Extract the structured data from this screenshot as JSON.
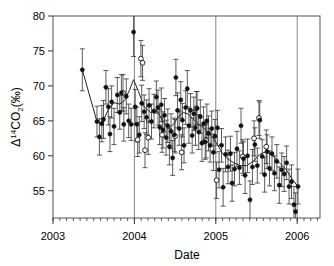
{
  "chart_data": {
    "type": "scatter",
    "title": "",
    "xlabel": "Date",
    "ylabel": "Δ¹⁴CO₂ (‰)",
    "ylabel_parts": {
      "delta": "Δ",
      "mass": "14",
      "species": "CO",
      "species_sub": "2",
      "units": "(‰)"
    },
    "xlim": [
      2003.0,
      2006.28
    ],
    "ylim": [
      51.1,
      80.0
    ],
    "xticks": [
      2003,
      2004,
      2005,
      2006
    ],
    "xtick_labels": [
      "2003",
      "2004",
      "2005",
      "2006"
    ],
    "yticks": [
      55,
      60,
      65,
      70,
      75,
      80
    ],
    "ytick_labels": [
      "55",
      "60",
      "65",
      "70",
      "75",
      "80"
    ],
    "x_minor_tick_interval": 0.08333,
    "grid": "vertical-only-at-year-boundaries",
    "gridlines_x": [
      2004,
      2005,
      2006
    ],
    "legend": "none",
    "marker_styles": {
      "filled": "filled-circle",
      "open": "open-circle"
    },
    "errorbars": true,
    "connecting_line": true,
    "series": [
      {
        "name": "filled",
        "marker": "filled-circle",
        "points": [
          {
            "x": 2003.36,
            "y": 72.3,
            "e": 3.0
          },
          {
            "x": 2003.54,
            "y": 64.9,
            "e": 2.2
          },
          {
            "x": 2003.57,
            "y": 62.7,
            "e": 2.6
          },
          {
            "x": 2003.6,
            "y": 64.6,
            "e": 2.6
          },
          {
            "x": 2003.62,
            "y": 65.2,
            "e": 2.7
          },
          {
            "x": 2003.65,
            "y": 69.8,
            "e": 2.4
          },
          {
            "x": 2003.68,
            "y": 67.0,
            "e": 2.6
          },
          {
            "x": 2003.7,
            "y": 63.1,
            "e": 2.5
          },
          {
            "x": 2003.72,
            "y": 67.7,
            "e": 2.3
          },
          {
            "x": 2003.75,
            "y": 64.2,
            "e": 2.6
          },
          {
            "x": 2003.79,
            "y": 68.7,
            "e": 2.5
          },
          {
            "x": 2003.82,
            "y": 66.2,
            "e": 2.4
          },
          {
            "x": 2003.84,
            "y": 69.0,
            "e": 2.6
          },
          {
            "x": 2003.87,
            "y": 64.5,
            "e": 2.4
          },
          {
            "x": 2003.9,
            "y": 68.5,
            "e": 2.5
          },
          {
            "x": 2003.93,
            "y": 65.0,
            "e": 2.4
          },
          {
            "x": 2003.96,
            "y": 64.5,
            "e": 2.3
          },
          {
            "x": 2003.99,
            "y": 77.7,
            "e": 3.5
          },
          {
            "x": 2004.01,
            "y": 67.0,
            "e": 2.5
          },
          {
            "x": 2004.03,
            "y": 64.5,
            "e": 2.5
          },
          {
            "x": 2004.06,
            "y": 63.0,
            "e": 2.6
          },
          {
            "x": 2004.09,
            "y": 67.5,
            "e": 2.6
          },
          {
            "x": 2004.12,
            "y": 66.3,
            "e": 2.4
          },
          {
            "x": 2004.15,
            "y": 65.5,
            "e": 2.5
          },
          {
            "x": 2004.18,
            "y": 67.2,
            "e": 2.4
          },
          {
            "x": 2004.21,
            "y": 64.9,
            "e": 2.5
          },
          {
            "x": 2004.24,
            "y": 66.4,
            "e": 2.4
          },
          {
            "x": 2004.27,
            "y": 68.4,
            "e": 2.3
          },
          {
            "x": 2004.29,
            "y": 66.9,
            "e": 2.5
          },
          {
            "x": 2004.31,
            "y": 64.1,
            "e": 2.5
          },
          {
            "x": 2004.33,
            "y": 67.3,
            "e": 2.4
          },
          {
            "x": 2004.35,
            "y": 63.7,
            "e": 2.6
          },
          {
            "x": 2004.37,
            "y": 65.8,
            "e": 2.4
          },
          {
            "x": 2004.39,
            "y": 62.6,
            "e": 2.5
          },
          {
            "x": 2004.41,
            "y": 64.3,
            "e": 2.4
          },
          {
            "x": 2004.43,
            "y": 61.3,
            "e": 2.6
          },
          {
            "x": 2004.45,
            "y": 63.5,
            "e": 2.5
          },
          {
            "x": 2004.47,
            "y": 59.7,
            "e": 2.5
          },
          {
            "x": 2004.49,
            "y": 63.0,
            "e": 2.4
          },
          {
            "x": 2004.51,
            "y": 71.2,
            "e": 2.6
          },
          {
            "x": 2004.53,
            "y": 66.5,
            "e": 2.5
          },
          {
            "x": 2004.55,
            "y": 63.9,
            "e": 2.4
          },
          {
            "x": 2004.57,
            "y": 68.0,
            "e": 2.6
          },
          {
            "x": 2004.59,
            "y": 65.1,
            "e": 2.4
          },
          {
            "x": 2004.61,
            "y": 61.5,
            "e": 2.5
          },
          {
            "x": 2004.63,
            "y": 66.9,
            "e": 2.4
          },
          {
            "x": 2004.65,
            "y": 69.6,
            "e": 2.6
          },
          {
            "x": 2004.67,
            "y": 64.3,
            "e": 2.5
          },
          {
            "x": 2004.69,
            "y": 66.5,
            "e": 2.4
          },
          {
            "x": 2004.71,
            "y": 62.9,
            "e": 2.5
          },
          {
            "x": 2004.73,
            "y": 66.0,
            "e": 2.4
          },
          {
            "x": 2004.75,
            "y": 64.0,
            "e": 2.5
          },
          {
            "x": 2004.77,
            "y": 66.8,
            "e": 2.4
          },
          {
            "x": 2004.79,
            "y": 63.4,
            "e": 2.5
          },
          {
            "x": 2004.81,
            "y": 65.6,
            "e": 2.4
          },
          {
            "x": 2004.83,
            "y": 61.8,
            "e": 2.6
          },
          {
            "x": 2004.85,
            "y": 64.6,
            "e": 2.4
          },
          {
            "x": 2004.87,
            "y": 62.0,
            "e": 2.5
          },
          {
            "x": 2004.89,
            "y": 65.0,
            "e": 2.4
          },
          {
            "x": 2004.91,
            "y": 63.2,
            "e": 2.5
          },
          {
            "x": 2004.93,
            "y": 61.5,
            "e": 2.4
          },
          {
            "x": 2004.95,
            "y": 63.9,
            "e": 2.5
          },
          {
            "x": 2004.97,
            "y": 60.5,
            "e": 2.6
          },
          {
            "x": 2004.99,
            "y": 62.8,
            "e": 2.4
          },
          {
            "x": 2005.02,
            "y": 64.0,
            "e": 2.5
          },
          {
            "x": 2005.04,
            "y": 58.0,
            "e": 2.6
          },
          {
            "x": 2005.07,
            "y": 61.5,
            "e": 2.4
          },
          {
            "x": 2005.09,
            "y": 55.5,
            "e": 2.7
          },
          {
            "x": 2005.12,
            "y": 60.2,
            "e": 2.5
          },
          {
            "x": 2005.15,
            "y": 58.4,
            "e": 2.4
          },
          {
            "x": 2005.18,
            "y": 60.3,
            "e": 2.5
          },
          {
            "x": 2005.2,
            "y": 56.1,
            "e": 2.6
          },
          {
            "x": 2005.23,
            "y": 58.1,
            "e": 2.4
          },
          {
            "x": 2005.26,
            "y": 61.0,
            "e": 2.5
          },
          {
            "x": 2005.29,
            "y": 58.3,
            "e": 2.4
          },
          {
            "x": 2005.31,
            "y": 64.3,
            "e": 2.5
          },
          {
            "x": 2005.34,
            "y": 59.6,
            "e": 2.4
          },
          {
            "x": 2005.36,
            "y": 57.2,
            "e": 2.6
          },
          {
            "x": 2005.39,
            "y": 60.0,
            "e": 2.4
          },
          {
            "x": 2005.42,
            "y": 53.7,
            "e": 2.7
          },
          {
            "x": 2005.45,
            "y": 58.4,
            "e": 2.5
          },
          {
            "x": 2005.48,
            "y": 61.6,
            "e": 2.4
          },
          {
            "x": 2005.51,
            "y": 58.6,
            "e": 2.5
          },
          {
            "x": 2005.54,
            "y": 65.1,
            "e": 2.6
          },
          {
            "x": 2005.57,
            "y": 59.9,
            "e": 2.4
          },
          {
            "x": 2005.6,
            "y": 57.3,
            "e": 2.5
          },
          {
            "x": 2005.63,
            "y": 60.6,
            "e": 2.4
          },
          {
            "x": 2005.66,
            "y": 58.2,
            "e": 2.5
          },
          {
            "x": 2005.69,
            "y": 60.3,
            "e": 2.4
          },
          {
            "x": 2005.72,
            "y": 57.5,
            "e": 2.5
          },
          {
            "x": 2005.75,
            "y": 59.2,
            "e": 2.4
          },
          {
            "x": 2005.78,
            "y": 55.8,
            "e": 2.6
          },
          {
            "x": 2005.81,
            "y": 58.0,
            "e": 2.4
          },
          {
            "x": 2005.84,
            "y": 57.4,
            "e": 2.5
          },
          {
            "x": 2005.87,
            "y": 59.0,
            "e": 2.4
          },
          {
            "x": 2005.9,
            "y": 55.6,
            "e": 2.5
          },
          {
            "x": 2005.93,
            "y": 56.3,
            "e": 2.4
          },
          {
            "x": 2005.96,
            "y": 53.0,
            "e": 2.6
          },
          {
            "x": 2005.98,
            "y": 52.0,
            "e": 2.7
          },
          {
            "x": 2006.01,
            "y": 55.6,
            "e": 2.5
          }
        ]
      },
      {
        "name": "open",
        "marker": "open-circle",
        "points": [
          {
            "x": 2003.86,
            "y": 69.0,
            "e": 2.6
          },
          {
            "x": 2004.04,
            "y": 62.3,
            "e": 2.4
          },
          {
            "x": 2004.08,
            "y": 73.9,
            "e": 2.6
          },
          {
            "x": 2004.1,
            "y": 73.3,
            "e": 2.5
          },
          {
            "x": 2004.13,
            "y": 60.8,
            "e": 2.5
          },
          {
            "x": 2004.17,
            "y": 62.6,
            "e": 2.4
          },
          {
            "x": 2004.34,
            "y": 63.0,
            "e": 2.5
          },
          {
            "x": 2004.5,
            "y": 62.8,
            "e": 2.4
          },
          {
            "x": 2004.58,
            "y": 60.5,
            "e": 2.5
          },
          {
            "x": 2004.76,
            "y": 66.8,
            "e": 2.4
          },
          {
            "x": 2004.88,
            "y": 62.2,
            "e": 2.5
          },
          {
            "x": 2005.01,
            "y": 56.5,
            "e": 2.6
          },
          {
            "x": 2005.33,
            "y": 59.9,
            "e": 2.4
          },
          {
            "x": 2005.47,
            "y": 62.5,
            "e": 2.5
          },
          {
            "x": 2005.53,
            "y": 65.4,
            "e": 2.5
          },
          {
            "x": 2005.62,
            "y": 61.3,
            "e": 2.4
          }
        ]
      }
    ],
    "smooth_line": [
      {
        "x": 2003.36,
        "y": 72.3
      },
      {
        "x": 2003.54,
        "y": 64.9
      },
      {
        "x": 2003.6,
        "y": 64.6
      },
      {
        "x": 2003.68,
        "y": 66.6
      },
      {
        "x": 2003.75,
        "y": 67.6
      },
      {
        "x": 2003.82,
        "y": 67.4
      },
      {
        "x": 2003.88,
        "y": 67.9
      },
      {
        "x": 2003.94,
        "y": 69.4
      },
      {
        "x": 2003.99,
        "y": 70.9
      },
      {
        "x": 2004.05,
        "y": 69.2
      },
      {
        "x": 2004.12,
        "y": 67.0
      },
      {
        "x": 2004.2,
        "y": 66.2
      },
      {
        "x": 2004.28,
        "y": 66.4
      },
      {
        "x": 2004.35,
        "y": 65.0
      },
      {
        "x": 2004.42,
        "y": 63.9
      },
      {
        "x": 2004.48,
        "y": 64.5
      },
      {
        "x": 2004.54,
        "y": 65.6
      },
      {
        "x": 2004.6,
        "y": 66.2
      },
      {
        "x": 2004.66,
        "y": 66.0
      },
      {
        "x": 2004.72,
        "y": 65.3
      },
      {
        "x": 2004.78,
        "y": 64.6
      },
      {
        "x": 2004.84,
        "y": 64.1
      },
      {
        "x": 2004.9,
        "y": 63.4
      },
      {
        "x": 2004.96,
        "y": 62.6
      },
      {
        "x": 2005.02,
        "y": 61.6
      },
      {
        "x": 2005.08,
        "y": 60.4
      },
      {
        "x": 2005.14,
        "y": 59.6
      },
      {
        "x": 2005.22,
        "y": 59.0
      },
      {
        "x": 2005.3,
        "y": 58.6
      },
      {
        "x": 2005.38,
        "y": 58.6
      },
      {
        "x": 2005.46,
        "y": 59.2
      },
      {
        "x": 2005.54,
        "y": 60.2
      },
      {
        "x": 2005.62,
        "y": 60.6
      },
      {
        "x": 2005.7,
        "y": 60.0
      },
      {
        "x": 2005.78,
        "y": 59.0
      },
      {
        "x": 2005.86,
        "y": 58.1
      },
      {
        "x": 2005.94,
        "y": 56.6
      },
      {
        "x": 2006.01,
        "y": 55.6
      }
    ]
  }
}
